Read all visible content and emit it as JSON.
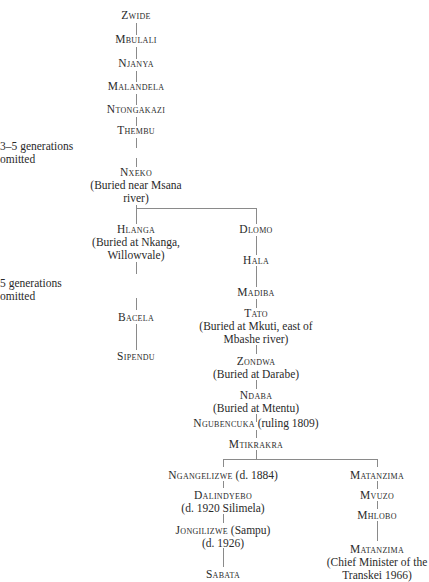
{
  "diagram": {
    "type": "genealogy-tree",
    "annotations": [
      {
        "id": "gap1",
        "text_line1": "3–5 generations",
        "text_line2": "omitted"
      },
      {
        "id": "gap2",
        "text_line1": "5 generations",
        "text_line2": "omitted"
      }
    ],
    "nodes": {
      "zwide": {
        "name": "Zwide"
      },
      "mbulali": {
        "name": "Mbulali"
      },
      "njanya": {
        "name": "Njanya"
      },
      "malandela": {
        "name": "Malandela"
      },
      "ntongakazi": {
        "name": "Ntongakazi"
      },
      "thembu": {
        "name": "Thembu"
      },
      "nxeko": {
        "name": "Nxeko",
        "note1": "(Buried near Msana",
        "note2": "river)"
      },
      "hlanga": {
        "name": "Hlanga",
        "note1": "(Buried at Nkanga,",
        "note2": "Willowvale)"
      },
      "bacela": {
        "name": "Bacela"
      },
      "sipendu": {
        "name": "Sipendu"
      },
      "dlomo": {
        "name": "Dlomo"
      },
      "hala": {
        "name": "Hala"
      },
      "madiba": {
        "name": "Madiba"
      },
      "tato": {
        "name": "Tato",
        "note1": "(Buried at Mkuti, east of",
        "note2": "Mbashe river)"
      },
      "zondwa": {
        "name": "Zondwa",
        "note1": "(Buried at Darabe)"
      },
      "ndaba": {
        "name": "Ndaba",
        "note1": "(Buried at Mtentu)"
      },
      "ngubencuka": {
        "name": "Ngubencuka",
        "suffix": " (ruling 1809)"
      },
      "mtikrakra": {
        "name": "Mtikrakra"
      },
      "ngangelizwe": {
        "name": "Ngangelizwe",
        "suffix": " (d. 1884)"
      },
      "dalindyebo": {
        "name": "Dalindyebo",
        "note1": "(d. 1920 Silimela)"
      },
      "jongilizwe": {
        "name": "Jongilizwe",
        "suffix": " (Sampu)",
        "note1": "(d. 1926)"
      },
      "sabata": {
        "name": "Sabata"
      },
      "matanzima1": {
        "name": "Matanzima"
      },
      "mvuzo": {
        "name": "Mvuzo"
      },
      "mhlobo": {
        "name": "Mhlobo"
      },
      "matanzima2": {
        "name": "Matanzima",
        "note1": "(Chief Minister of the",
        "note2": "Transkei 1966)"
      }
    }
  }
}
